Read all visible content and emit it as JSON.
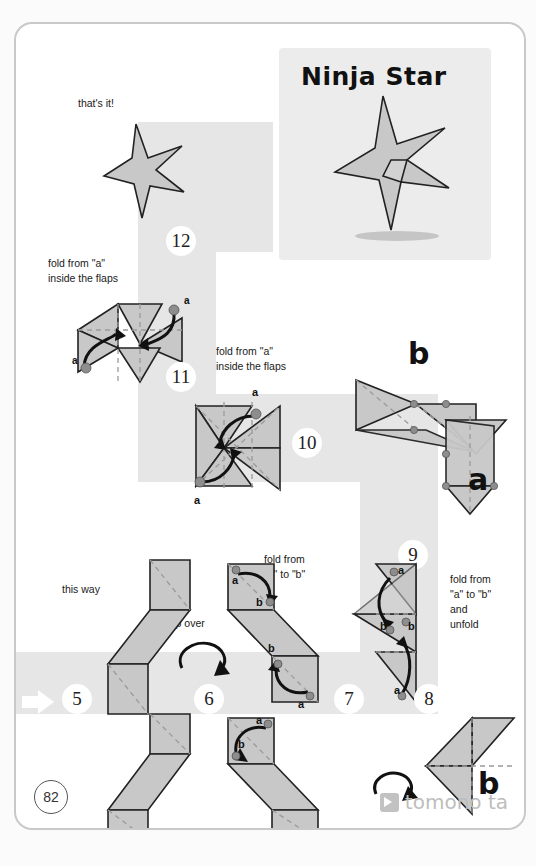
{
  "page": {
    "number": "82",
    "title": "Ninja Star",
    "brand": "tomono ta",
    "brand_icon": "tomonota-logo-icon"
  },
  "steps": [
    {
      "id": "12",
      "label": "12"
    },
    {
      "id": "11",
      "label": "11"
    },
    {
      "id": "10",
      "label": "10"
    },
    {
      "id": "9",
      "label": "9"
    },
    {
      "id": "8",
      "label": "8"
    },
    {
      "id": "7",
      "label": "7"
    },
    {
      "id": "6",
      "label": "6"
    },
    {
      "id": "5",
      "label": "5"
    }
  ],
  "notes": {
    "thats_it": "that's it!",
    "fold_inside_flaps_1": "fold from \"a\"\ninside the flaps",
    "fold_inside_flaps_2": "fold from \"a\"\ninside the flaps",
    "this_way": "this way",
    "flip_over": "flip over",
    "fold_a_to_b": "fold from\n\"a\" to \"b\"",
    "fold_a_to_b_unfold": "fold from\n\"a\" to \"b\"\nand\nunfold"
  },
  "markers": {
    "a": "a",
    "b": "b"
  },
  "big_labels": {
    "b_top": "b",
    "a_mid": "a",
    "a_lower": "a",
    "b_bottom": "b"
  },
  "colors": {
    "path_gray": "#e6e6e6",
    "panel_gray": "#ececec",
    "paper_fill": "#c8c8c8",
    "ink": "#222222",
    "valley_fold": "#9a9a9a",
    "brand_gray": "#bdbdbd"
  }
}
